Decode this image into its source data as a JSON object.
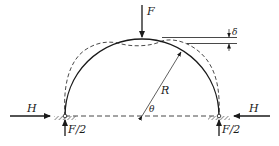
{
  "figure": {
    "labels": {
      "load": "F",
      "deflection": "δ",
      "radius": "R",
      "angle": "θ",
      "thrust_left": "H",
      "thrust_right": "H",
      "reaction_left": "F/2",
      "reaction_right": "F/2"
    },
    "colors": {
      "stroke": "#1a1a1a",
      "background": "#ffffff",
      "hatch": "#555555"
    }
  }
}
